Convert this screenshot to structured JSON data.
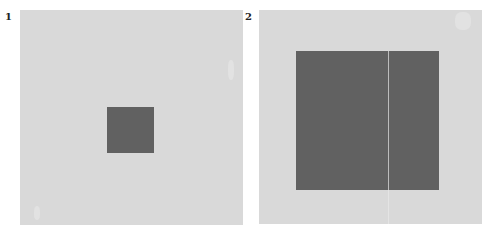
{
  "figures": [
    {
      "label": "1",
      "panel_color": "#d9d9d9",
      "square_color": "#616161",
      "description": "small dark gray square centered on large light gray field"
    },
    {
      "label": "2",
      "panel_color": "#d9d9d9",
      "square_color": "#616161",
      "description": "large dark gray square filling most of light gray field"
    }
  ]
}
